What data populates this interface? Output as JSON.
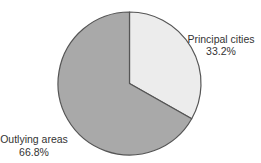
{
  "chart_data": {
    "type": "pie",
    "title": "",
    "start_angle_deg": 0,
    "direction": "clockwise",
    "slices": [
      {
        "label": "Principal cities",
        "value": 33.2,
        "value_label": "33.2%",
        "color": "#ececec"
      },
      {
        "label": "Outlying areas",
        "value": 66.8,
        "value_label": "66.8%",
        "color": "#a9a9a9"
      }
    ],
    "stroke_color": "#555555"
  }
}
